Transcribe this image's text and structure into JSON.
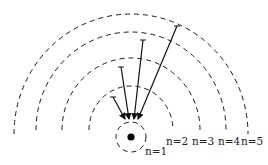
{
  "diagram": {
    "type": "energy-level transitions (Lyman series)",
    "nucleus": {
      "label": "",
      "color": "#000000"
    },
    "levels": [
      {
        "n": 1,
        "label": "n=1"
      },
      {
        "n": 2,
        "label": "n=2"
      },
      {
        "n": 3,
        "label": "n=3"
      },
      {
        "n": 4,
        "label": "n=4"
      },
      {
        "n": 5,
        "label": "n=5"
      }
    ],
    "transitions": [
      {
        "from": 2,
        "to": 1
      },
      {
        "from": 3,
        "to": 1
      },
      {
        "from": 4,
        "to": 1
      },
      {
        "from": 5,
        "to": 1
      }
    ],
    "colors": {
      "stroke": "#1a1a1a",
      "background": "#ffffff"
    }
  }
}
